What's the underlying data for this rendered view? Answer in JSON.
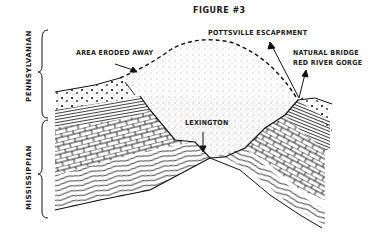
{
  "figure": {
    "title": "FIGURE #3"
  },
  "labels": {
    "pottsville": "POTTSVILLE ESCAPRMENT",
    "area_eroded": "AREA ERODED AWAY",
    "natural_bridge_line1": "NATURAL BRIDGE",
    "natural_bridge_line2": "RED RIVER GORGE",
    "lexington": "LEXINGTON"
  },
  "periods": {
    "upper": "PENNSYLVANIAN",
    "lower": "MISSISSIPPIAN"
  },
  "colors": {
    "ink": "#1a1a1a",
    "background": "#ffffff"
  }
}
